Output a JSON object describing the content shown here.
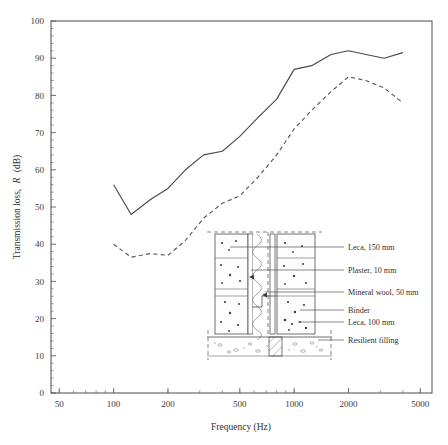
{
  "chart_data": {
    "type": "line",
    "title": "",
    "xlabel": "Frequency (Hz)",
    "ylabel": "Transmission loss, R (dB)",
    "ylabel_plain": "Transmission loss,",
    "ylabel_italic": "R",
    "ylabel_unit": "(dB)",
    "xscale": "log",
    "xlim": [
      45,
      5800
    ],
    "ylim": [
      0,
      100
    ],
    "grid": false,
    "legend_position": "none",
    "xticks": [
      50,
      100,
      200,
      500,
      1000,
      2000,
      5000
    ],
    "xtick_labels": [
      "50",
      "100",
      "200",
      "500",
      "1000",
      "2000",
      "5000"
    ],
    "yticks": [
      0,
      10,
      20,
      30,
      40,
      50,
      60,
      70,
      80,
      90,
      100
    ],
    "ytick_labels": [
      "0",
      "10",
      "20",
      "30",
      "40",
      "50",
      "60",
      "70",
      "80",
      "90",
      "100"
    ],
    "series": [
      {
        "name": "solid",
        "style": "solid",
        "x": [
          100,
          125,
          160,
          200,
          250,
          315,
          400,
          500,
          630,
          800,
          1000,
          1250,
          1600,
          2000,
          2500,
          3150,
          4000
        ],
        "values": [
          56,
          48,
          52,
          55,
          60,
          64,
          65,
          69,
          74,
          79,
          87,
          88,
          91,
          92,
          91,
          90,
          91.5
        ]
      },
      {
        "name": "dashed",
        "style": "dashed",
        "x": [
          100,
          125,
          160,
          200,
          250,
          315,
          400,
          500,
          630,
          800,
          1000,
          1250,
          1600,
          2000,
          2500,
          3150,
          4000
        ],
        "values": [
          40,
          36.5,
          37.5,
          37,
          41,
          47,
          51,
          53,
          58,
          64,
          71,
          76,
          81,
          85,
          84,
          82,
          78
        ]
      }
    ]
  },
  "inset": {
    "name": "wall-section-diagram",
    "labels": [
      {
        "text": "Leca, 150 mm"
      },
      {
        "text": "Plaster, 10 mm"
      },
      {
        "text": "Mineral wool, 50 mm"
      },
      {
        "text": "Binder"
      },
      {
        "text": "Leca, 100 mm"
      },
      {
        "text": "Resilient filling"
      }
    ]
  },
  "colors": {
    "axis": "#4a4a4a",
    "series_solid": "#4a4a4a",
    "series_dashed": "#5a5a5a",
    "text": "#2f2f2f",
    "background": "#ffffff"
  }
}
